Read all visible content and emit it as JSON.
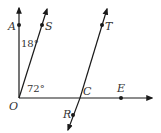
{
  "diagram": {
    "points": {
      "A": {
        "label": "A"
      },
      "S": {
        "label": "S"
      },
      "O": {
        "label": "O"
      },
      "T": {
        "label": "T"
      },
      "C": {
        "label": "C"
      },
      "E": {
        "label": "E"
      },
      "R": {
        "label": "R"
      }
    },
    "angles": {
      "AOS": "18°",
      "SOE": "72°"
    },
    "colors": {
      "line": "#1a1a1a",
      "text": "#333333"
    }
  }
}
